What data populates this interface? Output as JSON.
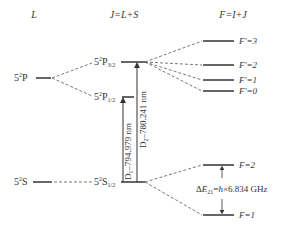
{
  "headers": {
    "col1": "L",
    "col2": "J=L+S",
    "col3": "F=I+J"
  },
  "levels": {
    "p_term": {
      "base": "5",
      "sup": "2",
      "letter": "P"
    },
    "p32": {
      "base": "5",
      "sup": "2",
      "letter": "P",
      "sub": "3/2"
    },
    "p12": {
      "base": "5",
      "sup": "2",
      "letter": "P",
      "sub": "1/2"
    },
    "s_term": {
      "base": "5",
      "sup": "2",
      "letter": "S"
    },
    "s12": {
      "base": "5",
      "sup": "2",
      "letter": "S",
      "sub": "1/2"
    }
  },
  "hyperfine_excited": [
    {
      "label": "F'=3"
    },
    {
      "label": "F'=2"
    },
    {
      "label": "F'=1"
    },
    {
      "label": "F'=0"
    }
  ],
  "hyperfine_ground": [
    {
      "label": "F=2"
    },
    {
      "label": "F=1"
    }
  ],
  "transitions": {
    "d1": {
      "name": "D",
      "sub": "1",
      "text": "–794.979 nm"
    },
    "d2": {
      "name": "D",
      "sub": "2",
      "text": "–780.241 nm"
    }
  },
  "splitting": {
    "delta": "Δ",
    "E": "E",
    "sub": "21",
    "eq": "=",
    "h": "h",
    "rest": "×6.834 GHz"
  },
  "colors": {
    "line": "#333333",
    "dash": "#555555"
  }
}
